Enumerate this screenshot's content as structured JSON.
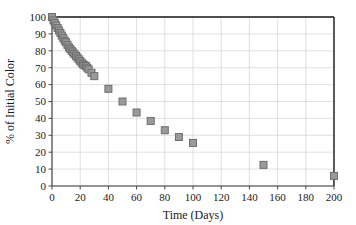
{
  "chart_data": {
    "type": "scatter",
    "title": "",
    "xlabel": "Time (Days)",
    "ylabel": "% of Initial Color",
    "xlim": [
      0,
      200
    ],
    "ylim": [
      0,
      100
    ],
    "xticks": [
      0,
      20,
      40,
      60,
      80,
      100,
      120,
      140,
      160,
      180,
      200
    ],
    "yticks": [
      0,
      10,
      20,
      30,
      40,
      50,
      60,
      70,
      80,
      90,
      100
    ],
    "xtick_labels": [
      "0",
      "20",
      "40",
      "60",
      "80",
      "100",
      "120",
      "140",
      "160",
      "180",
      "200"
    ],
    "ytick_labels": [
      "0",
      "10",
      "20",
      "30",
      "40",
      "50",
      "60",
      "70",
      "80",
      "90",
      "100"
    ],
    "grid": true,
    "legend": null,
    "marker": {
      "shape": "square",
      "fill_color": "#9a9a9a",
      "edge_color": "#6e6e6e",
      "size_px": 7
    },
    "series": [
      {
        "name": "% of Initial Color",
        "points": [
          {
            "x": 0,
            "y": 100
          },
          {
            "x": 1,
            "y": 98
          },
          {
            "x": 2,
            "y": 96.5
          },
          {
            "x": 3,
            "y": 95
          },
          {
            "x": 4,
            "y": 93.5
          },
          {
            "x": 5,
            "y": 92
          },
          {
            "x": 6,
            "y": 90.5
          },
          {
            "x": 7,
            "y": 89
          },
          {
            "x": 8,
            "y": 87.5
          },
          {
            "x": 9,
            "y": 86
          },
          {
            "x": 10,
            "y": 85
          },
          {
            "x": 11,
            "y": 83.5
          },
          {
            "x": 12,
            "y": 82
          },
          {
            "x": 13,
            "y": 81
          },
          {
            "x": 14,
            "y": 80
          },
          {
            "x": 15,
            "y": 79
          },
          {
            "x": 16,
            "y": 78
          },
          {
            "x": 17,
            "y": 77
          },
          {
            "x": 18,
            "y": 76
          },
          {
            "x": 19,
            "y": 75
          },
          {
            "x": 20,
            "y": 74
          },
          {
            "x": 21,
            "y": 73
          },
          {
            "x": 22,
            "y": 72
          },
          {
            "x": 23,
            "y": 71.5
          },
          {
            "x": 24,
            "y": 71
          },
          {
            "x": 25,
            "y": 70
          },
          {
            "x": 26,
            "y": 69
          },
          {
            "x": 28,
            "y": 67
          },
          {
            "x": 30,
            "y": 65
          },
          {
            "x": 40,
            "y": 57.5
          },
          {
            "x": 50,
            "y": 50
          },
          {
            "x": 60,
            "y": 43.5
          },
          {
            "x": 70,
            "y": 38.5
          },
          {
            "x": 80,
            "y": 33
          },
          {
            "x": 90,
            "y": 29
          },
          {
            "x": 100,
            "y": 25.5
          },
          {
            "x": 150,
            "y": 12.5
          },
          {
            "x": 200,
            "y": 6
          }
        ]
      }
    ]
  },
  "style": {
    "frame_color": "#1a1a1a",
    "grid_color": "#d8d8d8",
    "tick_color": "#4a4a4a",
    "background": "#ffffff"
  }
}
